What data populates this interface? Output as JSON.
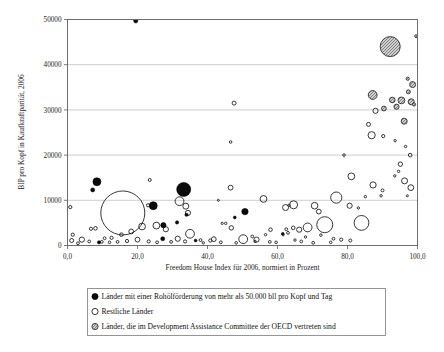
{
  "chart": {
    "type": "scatter",
    "xlabel": "Freedom House Index für 2006, normiert in Prozent",
    "ylabel": "BIP pro Kopf in Kaufkraftparität, 2006",
    "title": "",
    "xlim": [
      0,
      100
    ],
    "ylim": [
      0,
      50000
    ],
    "xticks": [
      "0,0",
      "20,0",
      "40,0",
      "60,0",
      "80,0",
      "100,0"
    ],
    "xtick_values": [
      0,
      20,
      40,
      60,
      80,
      100
    ],
    "yticks": [
      "0",
      "10000",
      "20000",
      "30000",
      "40000",
      "50000"
    ],
    "ytick_values": [
      0,
      10000,
      20000,
      30000,
      40000,
      50000
    ],
    "grid": "horizontal",
    "legend_position": "below-axis"
  },
  "legend": {
    "items": [
      {
        "marker": "filled-black-circle",
        "label": "Länder mit einer Rohölförderung von mehr als 50.000 bll pro Kopf und Tag"
      },
      {
        "marker": "open-circle",
        "label": "Restliche Länder"
      },
      {
        "marker": "hatched-grey-circle",
        "label": "Länder, die im Development Assistance Committee der OECD vertreten sind"
      }
    ]
  },
  "colors": {
    "oil": "#0b0b0b",
    "other": "#ffffff",
    "dac": "#9a9a9a",
    "grid": "#b9b9b9",
    "frame": "#6e6e6e"
  },
  "chart_data": {
    "type": "scatter",
    "title": "",
    "xlabel": "Freedom House Index für 2006, normiert in Prozent",
    "ylabel": "BIP pro Kopf in Kaufkraftparität, 2006",
    "xlim": [
      0,
      100
    ],
    "ylim": [
      0,
      50000
    ],
    "categories": [
      "Länder mit einer Rohölförderung von mehr als 50.000 bll pro Kopf und Tag",
      "Restliche Länder",
      "Länder, die im Development Assistance Committee der OECD vertreten sind"
    ],
    "grid": "horizontal gridlines every 10000",
    "legend": [
      "Länder mit einer Rohölförderung von mehr als 50.000 bll pro Kopf und Tag",
      "Restliche Länder",
      "Länder, die im Development Assistance Committee der OECD vertreten sind"
    ],
    "note": "Bubble size encodes population; x = Freedom House Index (%), y = GDP per capita PPP 2006",
    "series": [
      {
        "name": "Länder mit einer Rohölförderung von mehr als 50.000 bll pro Kopf und Tag",
        "marker": "filled-black-circle",
        "points": [
          {
            "x": 19.5,
            "y": 49700,
            "r": 2.1
          },
          {
            "x": 8.4,
            "y": 14100,
            "r": 4.0
          },
          {
            "x": 7.2,
            "y": 12300,
            "r": 2.0
          },
          {
            "x": 33.2,
            "y": 12400,
            "r": 7.0
          },
          {
            "x": 24.5,
            "y": 8800,
            "r": 4.0
          },
          {
            "x": 50.7,
            "y": 7500,
            "r": 3.2
          },
          {
            "x": 27.4,
            "y": 4500,
            "r": 2.6
          },
          {
            "x": 31.3,
            "y": 5100,
            "r": 1.6
          },
          {
            "x": 34.0,
            "y": 6800,
            "r": 1.6
          },
          {
            "x": 27.2,
            "y": 1500,
            "r": 2.0
          },
          {
            "x": 36.6,
            "y": 1100,
            "r": 1.4
          },
          {
            "x": 47.8,
            "y": 6200,
            "r": 1.4
          },
          {
            "x": 61.5,
            "y": 2600,
            "r": 1.3
          },
          {
            "x": 9.0,
            "y": 700,
            "r": 1.6
          }
        ]
      },
      {
        "name": "Restliche Länder",
        "marker": "open-circle",
        "points": [
          {
            "x": 47.6,
            "y": 31500,
            "r": 2.0
          },
          {
            "x": 46.6,
            "y": 22900,
            "r": 1.3
          },
          {
            "x": 79.0,
            "y": 20000,
            "r": 1.3
          },
          {
            "x": 88.0,
            "y": 29800,
            "r": 2.6
          },
          {
            "x": 86.0,
            "y": 26800,
            "r": 2.0
          },
          {
            "x": 86.9,
            "y": 24400,
            "r": 3.6
          },
          {
            "x": 90.2,
            "y": 24200,
            "r": 1.6
          },
          {
            "x": 93.6,
            "y": 23200,
            "r": 1.2
          },
          {
            "x": 96.6,
            "y": 21900,
            "r": 1.2
          },
          {
            "x": 97.9,
            "y": 20000,
            "r": 1.8
          },
          {
            "x": 95.1,
            "y": 18000,
            "r": 2.2
          },
          {
            "x": 94.6,
            "y": 16400,
            "r": 1.2
          },
          {
            "x": 96.3,
            "y": 14300,
            "r": 3.0
          },
          {
            "x": 93.5,
            "y": 15400,
            "r": 1.2
          },
          {
            "x": 81.1,
            "y": 15300,
            "r": 3.4
          },
          {
            "x": 87.3,
            "y": 13400,
            "r": 3.1
          },
          {
            "x": 98.1,
            "y": 12800,
            "r": 2.9
          },
          {
            "x": 90.0,
            "y": 12200,
            "r": 1.5
          },
          {
            "x": 89.6,
            "y": 11000,
            "r": 1.2
          },
          {
            "x": 97.1,
            "y": 11000,
            "r": 1.0
          },
          {
            "x": 85.1,
            "y": 10800,
            "r": 1.2
          },
          {
            "x": 46.6,
            "y": 12800,
            "r": 2.4
          },
          {
            "x": 23.5,
            "y": 14500,
            "r": 1.5
          },
          {
            "x": 15.8,
            "y": 7200,
            "r": 22.0
          },
          {
            "x": 32.0,
            "y": 9800,
            "r": 4.4
          },
          {
            "x": 33.8,
            "y": 8700,
            "r": 3.0
          },
          {
            "x": 34.4,
            "y": 7200,
            "r": 2.6
          },
          {
            "x": 23.0,
            "y": 8900,
            "r": 1.6
          },
          {
            "x": 0.8,
            "y": 8500,
            "r": 1.6
          },
          {
            "x": 43.1,
            "y": 10000,
            "r": 1.0
          },
          {
            "x": 56.0,
            "y": 10300,
            "r": 3.4
          },
          {
            "x": 62.3,
            "y": 8400,
            "r": 3.0
          },
          {
            "x": 64.6,
            "y": 9000,
            "r": 4.0
          },
          {
            "x": 63.3,
            "y": 8900,
            "r": 1.2
          },
          {
            "x": 70.6,
            "y": 8800,
            "r": 3.3
          },
          {
            "x": 71.8,
            "y": 7500,
            "r": 2.4
          },
          {
            "x": 76.8,
            "y": 10600,
            "r": 5.6
          },
          {
            "x": 80.6,
            "y": 8800,
            "r": 2.6
          },
          {
            "x": 83.1,
            "y": 8300,
            "r": 1.2
          },
          {
            "x": 84.0,
            "y": 5000,
            "r": 7.4
          },
          {
            "x": 73.5,
            "y": 4600,
            "r": 8.0
          },
          {
            "x": 68.6,
            "y": 4000,
            "r": 4.4
          },
          {
            "x": 66.2,
            "y": 3500,
            "r": 2.6
          },
          {
            "x": 64.5,
            "y": 3900,
            "r": 1.8
          },
          {
            "x": 62.5,
            "y": 3600,
            "r": 1.4
          },
          {
            "x": 63.0,
            "y": 2800,
            "r": 1.4
          },
          {
            "x": 61.6,
            "y": 2400,
            "r": 1.2
          },
          {
            "x": 58.0,
            "y": 3500,
            "r": 1.8
          },
          {
            "x": 56.6,
            "y": 2400,
            "r": 1.2
          },
          {
            "x": 54.0,
            "y": 1300,
            "r": 2.6
          },
          {
            "x": 52.8,
            "y": 2000,
            "r": 1.4
          },
          {
            "x": 50.2,
            "y": 1400,
            "r": 4.4
          },
          {
            "x": 46.8,
            "y": 3900,
            "r": 2.2
          },
          {
            "x": 45.2,
            "y": 4900,
            "r": 1.2
          },
          {
            "x": 44.2,
            "y": 4900,
            "r": 1.1
          },
          {
            "x": 41.8,
            "y": 1400,
            "r": 2.4
          },
          {
            "x": 40.8,
            "y": 1100,
            "r": 1.6
          },
          {
            "x": 38.0,
            "y": 1200,
            "r": 1.4
          },
          {
            "x": 35.0,
            "y": 2600,
            "r": 4.4
          },
          {
            "x": 31.5,
            "y": 1500,
            "r": 2.6
          },
          {
            "x": 28.1,
            "y": 3600,
            "r": 2.6
          },
          {
            "x": 25.4,
            "y": 4400,
            "r": 3.4
          },
          {
            "x": 21.3,
            "y": 4200,
            "r": 3.4
          },
          {
            "x": 18.2,
            "y": 3100,
            "r": 2.4
          },
          {
            "x": 15.4,
            "y": 2400,
            "r": 1.8
          },
          {
            "x": 12.6,
            "y": 1700,
            "r": 1.6
          },
          {
            "x": 10.6,
            "y": 1600,
            "r": 1.4
          },
          {
            "x": 8.0,
            "y": 3800,
            "r": 1.8
          },
          {
            "x": 6.7,
            "y": 3700,
            "r": 1.6
          },
          {
            "x": 4.1,
            "y": 1300,
            "r": 2.6
          },
          {
            "x": 1.5,
            "y": 2400,
            "r": 1.6
          },
          {
            "x": 1.2,
            "y": 1100,
            "r": 2.0
          },
          {
            "x": 3.0,
            "y": 500,
            "r": 1.4
          },
          {
            "x": 6.2,
            "y": 900,
            "r": 1.4
          },
          {
            "x": 9.8,
            "y": 800,
            "r": 1.4
          },
          {
            "x": 12.0,
            "y": 700,
            "r": 1.3
          },
          {
            "x": 14.3,
            "y": 800,
            "r": 1.4
          },
          {
            "x": 17.0,
            "y": 1000,
            "r": 1.6
          },
          {
            "x": 20.0,
            "y": 1300,
            "r": 2.4
          },
          {
            "x": 23.2,
            "y": 900,
            "r": 1.6
          },
          {
            "x": 25.6,
            "y": 700,
            "r": 1.4
          },
          {
            "x": 29.6,
            "y": 800,
            "r": 1.4
          },
          {
            "x": 33.6,
            "y": 900,
            "r": 1.6
          },
          {
            "x": 43.8,
            "y": 700,
            "r": 1.4
          },
          {
            "x": 48.2,
            "y": 600,
            "r": 1.3
          },
          {
            "x": 57.8,
            "y": 800,
            "r": 1.4
          },
          {
            "x": 59.6,
            "y": 700,
            "r": 1.3
          },
          {
            "x": 66.8,
            "y": 900,
            "r": 1.4
          },
          {
            "x": 70.2,
            "y": 600,
            "r": 1.4
          },
          {
            "x": 75.2,
            "y": 700,
            "r": 1.3
          },
          {
            "x": 78.2,
            "y": 1300,
            "r": 1.6
          },
          {
            "x": 80.8,
            "y": 1100,
            "r": 1.5
          },
          {
            "x": 76.0,
            "y": 1500,
            "r": 1.4
          },
          {
            "x": 72.4,
            "y": 2300,
            "r": 1.3
          },
          {
            "x": 68.0,
            "y": 1900,
            "r": 1.2
          },
          {
            "x": 65.0,
            "y": 1200,
            "r": 1.2
          },
          {
            "x": 53.6,
            "y": 900,
            "r": 1.2
          },
          {
            "x": 38.8,
            "y": 600,
            "r": 1.2
          }
        ]
      },
      {
        "name": "Länder, die im Development Assistance Committee der OECD vertreten sind",
        "marker": "hatched-grey-circle",
        "points": [
          {
            "x": 92.2,
            "y": 44000,
            "r": 10.0
          },
          {
            "x": 99.6,
            "y": 46300,
            "r": 1.4
          },
          {
            "x": 97.2,
            "y": 36900,
            "r": 1.6
          },
          {
            "x": 98.6,
            "y": 35600,
            "r": 3.0
          },
          {
            "x": 97.4,
            "y": 34000,
            "r": 2.0
          },
          {
            "x": 87.2,
            "y": 33300,
            "r": 4.4
          },
          {
            "x": 92.8,
            "y": 32200,
            "r": 2.8
          },
          {
            "x": 95.4,
            "y": 32100,
            "r": 3.4
          },
          {
            "x": 98.2,
            "y": 31800,
            "r": 3.0
          },
          {
            "x": 94.0,
            "y": 30700,
            "r": 2.6
          },
          {
            "x": 90.4,
            "y": 30300,
            "r": 2.4
          },
          {
            "x": 96.2,
            "y": 27500,
            "r": 3.0
          },
          {
            "x": 99.0,
            "y": 31200,
            "r": 1.6
          }
        ]
      }
    ]
  }
}
